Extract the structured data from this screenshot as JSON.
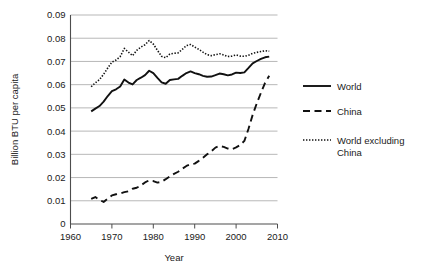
{
  "chart_data": {
    "type": "line",
    "title": "",
    "xlabel": "Year",
    "ylabel": "Billion BTU per capita",
    "xlim": [
      1960,
      2010
    ],
    "ylim": [
      0,
      0.09
    ],
    "xticks": [
      1960,
      1970,
      1980,
      1990,
      2000,
      2010
    ],
    "xtick_labels": [
      "1960",
      "1970",
      "1980",
      "1990",
      "2000",
      "2010"
    ],
    "yticks": [
      0,
      0.01,
      0.02,
      0.03,
      0.04,
      0.05,
      0.06,
      0.07,
      0.08,
      0.09
    ],
    "ytick_labels": [
      "0",
      "0.01",
      "0.02",
      "0.03",
      "0.04",
      "0.05",
      "0.06",
      "0.07",
      "0.08",
      "0.09"
    ],
    "grid": "horizontal",
    "legend_position": "right",
    "x": [
      1965,
      1966,
      1967,
      1968,
      1969,
      1970,
      1971,
      1972,
      1973,
      1974,
      1975,
      1976,
      1977,
      1978,
      1979,
      1980,
      1981,
      1982,
      1983,
      1984,
      1985,
      1986,
      1987,
      1988,
      1989,
      1990,
      1991,
      1992,
      1993,
      1994,
      1995,
      1996,
      1997,
      1998,
      1999,
      2000,
      2001,
      2002,
      2003,
      2004,
      2005,
      2006,
      2007,
      2008
    ],
    "series": [
      {
        "name": "World",
        "style": "solid",
        "color": "#111111",
        "values": [
          0.0485,
          0.0497,
          0.0508,
          0.0527,
          0.0551,
          0.0572,
          0.058,
          0.0592,
          0.0622,
          0.0609,
          0.0601,
          0.062,
          0.063,
          0.0641,
          0.066,
          0.065,
          0.0629,
          0.061,
          0.0604,
          0.062,
          0.0623,
          0.0625,
          0.0638,
          0.065,
          0.0657,
          0.065,
          0.0645,
          0.0638,
          0.0634,
          0.0635,
          0.0641,
          0.0648,
          0.0645,
          0.064,
          0.0644,
          0.0652,
          0.065,
          0.0653,
          0.0672,
          0.0692,
          0.0702,
          0.0711,
          0.0718,
          0.0721
        ]
      },
      {
        "name": "China",
        "style": "dashed",
        "color": "#111111",
        "values": [
          0.0108,
          0.0116,
          0.0104,
          0.0095,
          0.011,
          0.0123,
          0.0128,
          0.0131,
          0.0137,
          0.0141,
          0.0152,
          0.0156,
          0.0166,
          0.0179,
          0.0188,
          0.0185,
          0.0178,
          0.0182,
          0.0193,
          0.0205,
          0.0216,
          0.0225,
          0.0238,
          0.025,
          0.0257,
          0.026,
          0.0272,
          0.0285,
          0.03,
          0.0313,
          0.0329,
          0.0336,
          0.0332,
          0.0325,
          0.0322,
          0.033,
          0.034,
          0.0358,
          0.041,
          0.047,
          0.052,
          0.0565,
          0.0608,
          0.0638
        ]
      },
      {
        "name": "World excluding China",
        "style": "dotted",
        "color": "#111111",
        "values": [
          0.0591,
          0.0608,
          0.0622,
          0.0645,
          0.0672,
          0.0697,
          0.0706,
          0.0721,
          0.0756,
          0.074,
          0.0725,
          0.0748,
          0.0762,
          0.0772,
          0.079,
          0.0775,
          0.0748,
          0.0722,
          0.0716,
          0.0732,
          0.0735,
          0.0737,
          0.0752,
          0.0768,
          0.0773,
          0.0762,
          0.0752,
          0.074,
          0.0729,
          0.0725,
          0.0729,
          0.0733,
          0.0728,
          0.0721,
          0.0723,
          0.0728,
          0.0723,
          0.0722,
          0.0727,
          0.0735,
          0.0739,
          0.0743,
          0.0746,
          0.0744
        ]
      }
    ]
  },
  "legend": {
    "items": [
      {
        "label": "World"
      },
      {
        "label": "China"
      },
      {
        "label": "World excluding",
        "label2": "China"
      }
    ]
  }
}
